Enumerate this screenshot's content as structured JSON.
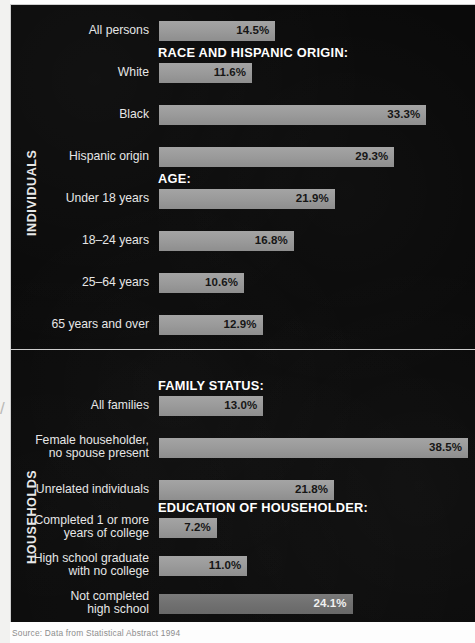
{
  "figure": {
    "background_color": "#0a0a0a",
    "bar_color": "#9a9a9a",
    "bar_color_dim": "#707070",
    "divider_color": "#cdcdcd",
    "caption": "Source: Data from Statistical Abstract 1994"
  },
  "sections": [
    {
      "id": "individuals",
      "band_label": "INDIVIDUALS"
    },
    {
      "id": "households",
      "band_label": "HOUSEHOLDS"
    }
  ],
  "headers": [
    {
      "id": "race",
      "text": "RACE AND HISPANIC ORIGIN:"
    },
    {
      "id": "age",
      "text": "AGE:"
    },
    {
      "id": "family",
      "text": "FAMILY STATUS:"
    },
    {
      "id": "education",
      "text": "EDUCATION OF HOUSEHOLDER:"
    }
  ],
  "chart_data": {
    "type": "bar",
    "orientation": "horizontal",
    "title": "",
    "xlabel": "",
    "ylabel": "",
    "xlim": [
      0,
      40
    ],
    "grid": false,
    "legend": null,
    "value_suffix": "%",
    "categories": [
      "All persons",
      "White",
      "Black",
      "Hispanic origin",
      "Under 18 years",
      "18–24 years",
      "25–64 years",
      "65 years and over",
      "All families",
      "Female householder, no spouse present",
      "Unrelated individuals",
      "Completed 1 or more years of college",
      "High school graduate with no college",
      "Not completed high school"
    ],
    "values": [
      14.5,
      11.6,
      33.3,
      29.3,
      21.9,
      16.8,
      10.6,
      12.9,
      13.0,
      38.5,
      21.8,
      7.2,
      11.0,
      24.1
    ],
    "labels": [
      "14.5%",
      "11.6%",
      "33.3%",
      "29.3%",
      "21.9%",
      "16.8%",
      "10.6%",
      "12.9%",
      "13.0%",
      "38.5%",
      "21.8%",
      "7.2%",
      "11.0%",
      "24.1%"
    ]
  },
  "bars": [
    {
      "id": "all-persons",
      "label": "All persons",
      "label_lines": 1,
      "value": 14.5,
      "value_label": "14.5%",
      "top": 16,
      "style": "light"
    },
    {
      "id": "white",
      "label": "White",
      "label_lines": 1,
      "value": 11.6,
      "value_label": "11.6%",
      "top": 58,
      "style": "light"
    },
    {
      "id": "black",
      "label": "Black",
      "label_lines": 1,
      "value": 33.3,
      "value_label": "33.3%",
      "top": 100,
      "style": "light"
    },
    {
      "id": "hispanic-origin",
      "label": "Hispanic origin",
      "label_lines": 1,
      "value": 29.3,
      "value_label": "29.3%",
      "top": 142,
      "style": "light"
    },
    {
      "id": "under-18",
      "label": "Under 18 years",
      "label_lines": 1,
      "value": 21.9,
      "value_label": "21.9%",
      "top": 184,
      "style": "light"
    },
    {
      "id": "18-24",
      "label": "18–24 years",
      "label_lines": 1,
      "value": 16.8,
      "value_label": "16.8%",
      "top": 226,
      "style": "light"
    },
    {
      "id": "25-64",
      "label": "25–64 years",
      "label_lines": 1,
      "value": 10.6,
      "value_label": "10.6%",
      "top": 268,
      "style": "light"
    },
    {
      "id": "65-over",
      "label": "65 years and over",
      "label_lines": 1,
      "value": 12.9,
      "value_label": "12.9%",
      "top": 310,
      "style": "light"
    },
    {
      "id": "all-families",
      "label": "All families",
      "label_lines": 1,
      "value": 13.0,
      "value_label": "13.0%",
      "top": 391,
      "style": "light"
    },
    {
      "id": "female-householder",
      "label": "Female householder,\nno spouse present",
      "label_lines": 2,
      "value": 38.5,
      "value_label": "38.5%",
      "top": 433,
      "style": "light"
    },
    {
      "id": "unrelated",
      "label": "Unrelated individuals",
      "label_lines": 1,
      "value": 21.8,
      "value_label": "21.8%",
      "top": 475,
      "style": "light"
    },
    {
      "id": "college",
      "label": "Completed 1 or more\nyears of college",
      "label_lines": 2,
      "value": 7.2,
      "value_label": "7.2%",
      "top": 513,
      "style": "light"
    },
    {
      "id": "hs-grad",
      "label": "High school graduate\nwith no college",
      "label_lines": 2,
      "value": 11.0,
      "value_label": "11.0%",
      "top": 551,
      "style": "light"
    },
    {
      "id": "not-hs",
      "label": "Not completed\nhigh school",
      "label_lines": 2,
      "value": 24.1,
      "value_label": "24.1%",
      "top": 589,
      "style": "dim"
    }
  ],
  "header_positions": [
    {
      "ref": "race",
      "top": 40
    },
    {
      "ref": "age",
      "top": 166
    },
    {
      "ref": "family",
      "top": 373
    },
    {
      "ref": "education",
      "top": 495
    }
  ]
}
